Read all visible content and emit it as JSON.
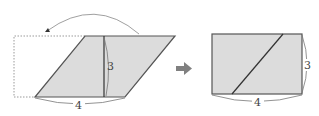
{
  "figure": {
    "before": {
      "shape": "parallelogram",
      "height_label": "3",
      "base_label": "4",
      "move_arrow": "curved-arrow-left",
      "moved_region": "dotted-rectangle-outline"
    },
    "transition_icon": "right-arrow-icon",
    "after": {
      "shape": "rectangle",
      "height_label": "3",
      "base_label": "4"
    }
  },
  "colors": {
    "fill": "#dcdcdc",
    "stroke": "#555555",
    "dotted": "#9a9a9a",
    "arrow": "#808080"
  }
}
